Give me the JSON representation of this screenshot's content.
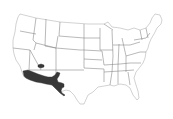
{
  "map": {
    "type": "choropleth",
    "region": "contiguous-united-states",
    "background_color": "#ffffff",
    "border_color": "#9a9a9a",
    "highlight_color": "#383838",
    "highlighted_areas": [
      {
        "name": "southwest-border-region",
        "description": "southern California, southern Arizona, southern New Mexico, far west Texas"
      },
      {
        "name": "small-inland-area",
        "description": "small area near southern Nevada / Utah border"
      }
    ]
  }
}
